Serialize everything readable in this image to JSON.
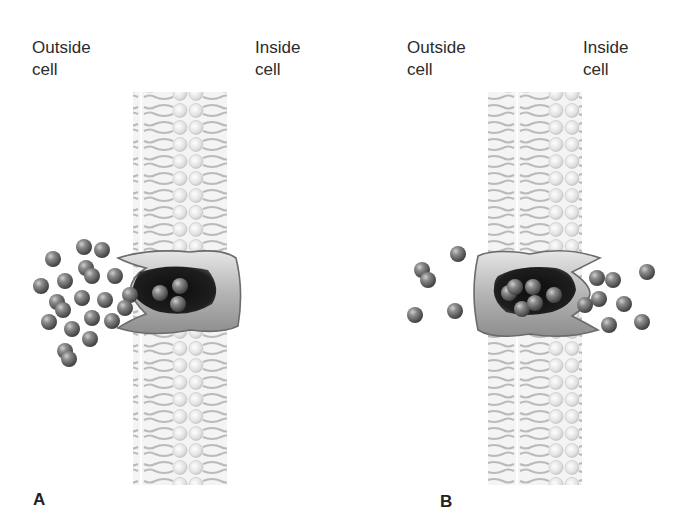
{
  "figure": {
    "panels": [
      {
        "id": "A",
        "letter": "A",
        "outside_label_line1": "Outside",
        "outside_label_line2": "cell",
        "inside_label_line1": "Inside",
        "inside_label_line2": "cell",
        "description": "Carrier protein open to outside of cell; many molecules outside, three molecules bound inside the carrier"
      },
      {
        "id": "B",
        "letter": "B",
        "outside_label_line1": "Outside",
        "outside_label_line2": "cell",
        "inside_label_line1": "Inside",
        "inside_label_line2": "cell",
        "description": "Carrier protein open to inside of cell; molecules released into cell interior"
      }
    ],
    "colors": {
      "molecule": "#6a6a6a",
      "carrier_body": "#bdbdbd",
      "carrier_cavity": "#151515",
      "membrane": "#c8c8c8"
    }
  }
}
